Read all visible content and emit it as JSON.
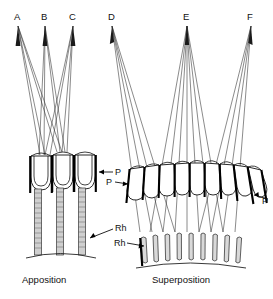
{
  "figure": {
    "title_visible": false,
    "background_color": "#ffffff",
    "ink_color": "#111111",
    "panels": [
      {
        "id": "apposition",
        "caption": "Apposition",
        "source_points": [
          {
            "label": "A"
          },
          {
            "label": "B"
          },
          {
            "label": "C"
          }
        ],
        "annotations": [
          {
            "label": "P",
            "meaning": "pigment"
          },
          {
            "label": "Rh",
            "meaning": "rhabdom"
          }
        ],
        "facet_count": 3,
        "rhabdom_count": 3
      },
      {
        "id": "superposition",
        "caption": "Superposition",
        "source_points": [
          {
            "label": "D"
          },
          {
            "label": "E"
          },
          {
            "label": "F"
          }
        ],
        "annotations": [
          {
            "label": "P",
            "meaning": "pigment"
          },
          {
            "label": "P",
            "meaning": "pigment"
          },
          {
            "label": "Rh",
            "meaning": "rhabdom"
          }
        ],
        "facet_count": 9,
        "rhabdom_count": 9
      }
    ]
  },
  "labels": {
    "a": "A",
    "b": "B",
    "c": "C",
    "d": "D",
    "e": "E",
    "f": "F",
    "p_app": "P",
    "rh_app": "Rh",
    "p_sup_left": "P",
    "p_sup_right": "P",
    "rh_sup": "Rh",
    "caption_app": "Apposition",
    "caption_sup": "Superposition"
  }
}
